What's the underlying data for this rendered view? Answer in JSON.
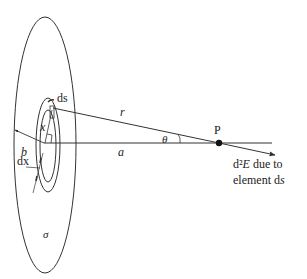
{
  "diagram": {
    "labels": {
      "ds": "ds",
      "x": "x",
      "b": "b",
      "a": "a",
      "r": "r",
      "theta": "θ",
      "point": "P",
      "dx": "dx",
      "sigma": "σ",
      "field_line1_prefix": "d²",
      "field_line1_var": "E",
      "field_line1_suffix": " due to",
      "field_line2_prefix": "element d",
      "field_line2_var": "s"
    },
    "colors": {
      "stroke": "#333333",
      "text": "#222222",
      "background": "#ffffff"
    }
  }
}
